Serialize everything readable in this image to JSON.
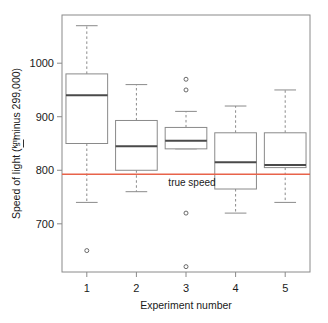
{
  "chart_data": {
    "type": "box",
    "title": "",
    "xlabel": "Experiment number",
    "ylabel": "Speed of light ( km / s  minus 299,000)",
    "ylabel_parts": {
      "prefix": "Speed of light (",
      "numerator": "km",
      "denominator": "s",
      "suffix": " minus 299,000)"
    },
    "categories": [
      "1",
      "2",
      "3",
      "4",
      "5"
    ],
    "x_tick_labels": [
      "1",
      "2",
      "3",
      "4",
      "5"
    ],
    "y_tick_labels": [
      "700",
      "800",
      "900",
      "1000"
    ],
    "y_tick_values": [
      700,
      800,
      900,
      1000
    ],
    "ylim": [
      610,
      1090
    ],
    "xlim": [
      0.5,
      5.5
    ],
    "grid": false,
    "legend": false,
    "reference_line": {
      "label": "true speed",
      "value": 792.458,
      "color": "#e8634a",
      "orientation": "horizontal"
    },
    "boxes": [
      {
        "category": "1",
        "lower_whisker": 740,
        "q1": 850,
        "median": 940,
        "q3": 980,
        "upper_whisker": 1070,
        "outliers": [
          650
        ]
      },
      {
        "category": "2",
        "lower_whisker": 760,
        "q1": 800,
        "median": 845,
        "q3": 893,
        "upper_whisker": 960,
        "outliers": []
      },
      {
        "category": "3",
        "lower_whisker": 840,
        "q1": 840,
        "median": 855,
        "q3": 880,
        "upper_whisker": 910,
        "outliers": [
          970,
          950,
          720,
          620
        ]
      },
      {
        "category": "4",
        "lower_whisker": 720,
        "q1": 765,
        "median": 815,
        "q3": 870,
        "upper_whisker": 920,
        "outliers": []
      },
      {
        "category": "5",
        "lower_whisker": 740,
        "q1": 805,
        "median": 810,
        "q3": 870,
        "upper_whisker": 950,
        "outliers": []
      }
    ]
  }
}
